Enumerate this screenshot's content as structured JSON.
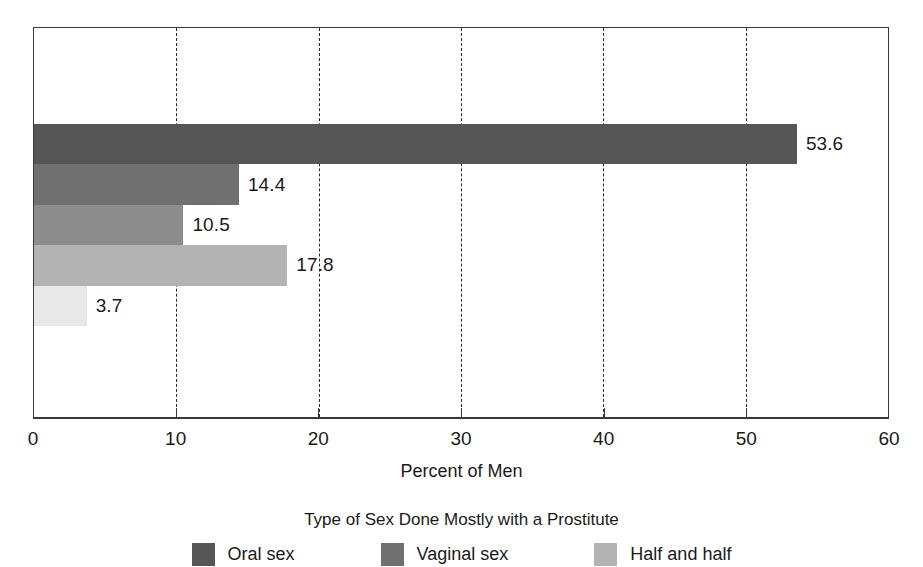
{
  "chart_data": {
    "type": "bar",
    "orientation": "horizontal",
    "title": "",
    "xlabel": "Percent of Men",
    "ylabel": "",
    "xlim": [
      0,
      60
    ],
    "xticks": [
      0,
      10,
      20,
      30,
      40,
      50,
      60
    ],
    "xtick_labels": [
      "0",
      "10",
      "20",
      "30",
      "40",
      "50",
      "60"
    ],
    "grid": "vertical dashed gridlines at 10, 20, 30, 40, 50",
    "legend_position": "below plot, centered",
    "legend_title": "Type of Sex Done Mostly with a Prostitute",
    "categories": [
      "Oral sex",
      "Vaginal sex",
      "Half and half",
      "Bar 4",
      "Bar 5"
    ],
    "values": [
      53.6,
      14.4,
      10.5,
      17.8,
      3.7
    ],
    "value_labels": [
      "53.6",
      "14.4",
      "10.5",
      "17.8",
      "3.7"
    ],
    "colors": [
      "#565656",
      "#707070",
      "#8d8d8d",
      "#b3b3b3",
      "#e8e8e8"
    ],
    "bars": [
      {
        "label": "Oral sex",
        "value": 53.6,
        "value_label": "53.6",
        "color": "#565656"
      },
      {
        "label": "Vaginal sex",
        "value": 14.4,
        "value_label": "14.4",
        "color": "#707070"
      },
      {
        "label": "Half and half",
        "value": 10.5,
        "value_label": "10.5",
        "color": "#8d8d8d"
      },
      {
        "label": "",
        "value": 17.8,
        "value_label": "17.8",
        "color": "#b3b3b3"
      },
      {
        "label": "",
        "value": 3.7,
        "value_label": "3.7",
        "color": "#e8e8e8"
      }
    ],
    "legend": [
      {
        "label": "Oral sex",
        "color": "#565656"
      },
      {
        "label": "Vaginal sex",
        "color": "#707070"
      },
      {
        "label": "Half and half",
        "color": "#b3b3b3"
      }
    ]
  }
}
